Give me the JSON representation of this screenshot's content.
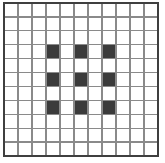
{
  "figure": {
    "canvas": {
      "width": 165,
      "height": 163,
      "background_color": "#ffffff"
    }
  },
  "grid": {
    "columns": 11,
    "rows": 11,
    "origin_x": 4,
    "origin_y": 3,
    "cell_width": 14,
    "cell_height": 13.9,
    "line_color": "#8a8a8a",
    "line_width": 1.2,
    "border_color": "#3f3f3f",
    "border_width": 2.2,
    "cell_fill_empty": "#ffffff"
  },
  "pattern": {
    "fill_color": "#3b3b3b",
    "filled_columns": [
      3,
      5,
      7
    ],
    "filled_rows": [
      3,
      5,
      7
    ],
    "filled_cells": [
      {
        "col": 3,
        "row": 3
      },
      {
        "col": 5,
        "row": 3
      },
      {
        "col": 7,
        "row": 3
      },
      {
        "col": 3,
        "row": 5
      },
      {
        "col": 5,
        "row": 5
      },
      {
        "col": 7,
        "row": 5
      },
      {
        "col": 3,
        "row": 7
      },
      {
        "col": 5,
        "row": 7
      },
      {
        "col": 7,
        "row": 7
      }
    ],
    "filled_count": 9
  },
  "chart_data": {
    "type": "heatmap",
    "title": "",
    "xlabel": "",
    "ylabel": "",
    "categories": [
      "1",
      "2",
      "3",
      "4",
      "5",
      "6",
      "7",
      "8",
      "9",
      "10",
      "11"
    ],
    "row_labels": [
      "1",
      "2",
      "3",
      "4",
      "5",
      "6",
      "7",
      "8",
      "9",
      "10",
      "11"
    ],
    "values": [
      [
        0,
        0,
        0,
        0,
        0,
        0,
        0,
        0,
        0,
        0,
        0
      ],
      [
        0,
        0,
        0,
        0,
        0,
        0,
        0,
        0,
        0,
        0,
        0
      ],
      [
        0,
        0,
        0,
        0,
        0,
        0,
        0,
        0,
        0,
        0,
        0
      ],
      [
        0,
        0,
        0,
        1,
        0,
        1,
        0,
        1,
        0,
        0,
        0
      ],
      [
        0,
        0,
        0,
        0,
        0,
        0,
        0,
        0,
        0,
        0,
        0
      ],
      [
        0,
        0,
        0,
        1,
        0,
        1,
        0,
        1,
        0,
        0,
        0
      ],
      [
        0,
        0,
        0,
        0,
        0,
        0,
        0,
        0,
        0,
        0,
        0
      ],
      [
        0,
        0,
        0,
        1,
        0,
        1,
        0,
        1,
        0,
        0,
        0
      ],
      [
        0,
        0,
        0,
        0,
        0,
        0,
        0,
        0,
        0,
        0,
        0
      ],
      [
        0,
        0,
        0,
        0,
        0,
        0,
        0,
        0,
        0,
        0,
        0
      ],
      [
        0,
        0,
        0,
        0,
        0,
        0,
        0,
        0,
        0,
        0,
        0
      ]
    ],
    "colorscale": [
      {
        "value": 0,
        "color": "#ffffff"
      },
      {
        "value": 1,
        "color": "#3b3b3b"
      }
    ],
    "grid": true,
    "legend": "none"
  }
}
